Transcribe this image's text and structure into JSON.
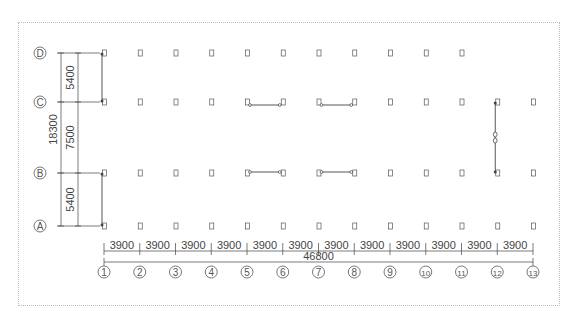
{
  "drawing": {
    "type": "structural-axis-grid-plan",
    "row_axes": [
      {
        "label": "D",
        "y": 53
      },
      {
        "label": "C",
        "y": 102
      },
      {
        "label": "B",
        "y": 173
      },
      {
        "label": "A",
        "y": 226
      }
    ],
    "column_axes": [
      "1",
      "2",
      "3",
      "4",
      "5",
      "6",
      "7",
      "8",
      "9",
      "10",
      "11",
      "12",
      "13"
    ],
    "column_x_start": 104,
    "column_spacing": 35.75,
    "row_d_column_count": 11,
    "bay_dimensions": [
      "3900",
      "3900",
      "3900",
      "3900",
      "3900",
      "3900",
      "3900",
      "3900",
      "3900",
      "3900",
      "3900",
      "3900"
    ],
    "total_width": "46800",
    "row_dimensions": [
      {
        "from": "D",
        "to": "C",
        "value": "5400"
      },
      {
        "from": "C",
        "to": "B",
        "value": "7500"
      },
      {
        "from": "B",
        "to": "A",
        "value": "5400"
      }
    ],
    "total_depth": "18300",
    "braces": [
      {
        "axis": "1",
        "from": "D",
        "to": "C",
        "orientation": "vertical"
      },
      {
        "axis": "1",
        "from": "B",
        "to": "A",
        "orientation": "vertical"
      },
      {
        "axis": "C",
        "from": "5",
        "to": "6",
        "orientation": "horizontal"
      },
      {
        "axis": "C",
        "from": "7",
        "to": "8",
        "orientation": "horizontal"
      },
      {
        "axis": "B",
        "from": "5",
        "to": "6",
        "orientation": "horizontal"
      },
      {
        "axis": "B",
        "from": "7",
        "to": "8",
        "orientation": "horizontal"
      },
      {
        "axis": "12",
        "from": "C",
        "to": "B",
        "orientation": "vertical",
        "with_turnbuckle": true
      }
    ],
    "colors": {
      "line": "#444444",
      "column": "#555555",
      "frame": "#bdbdbd",
      "text": "#444444"
    }
  }
}
